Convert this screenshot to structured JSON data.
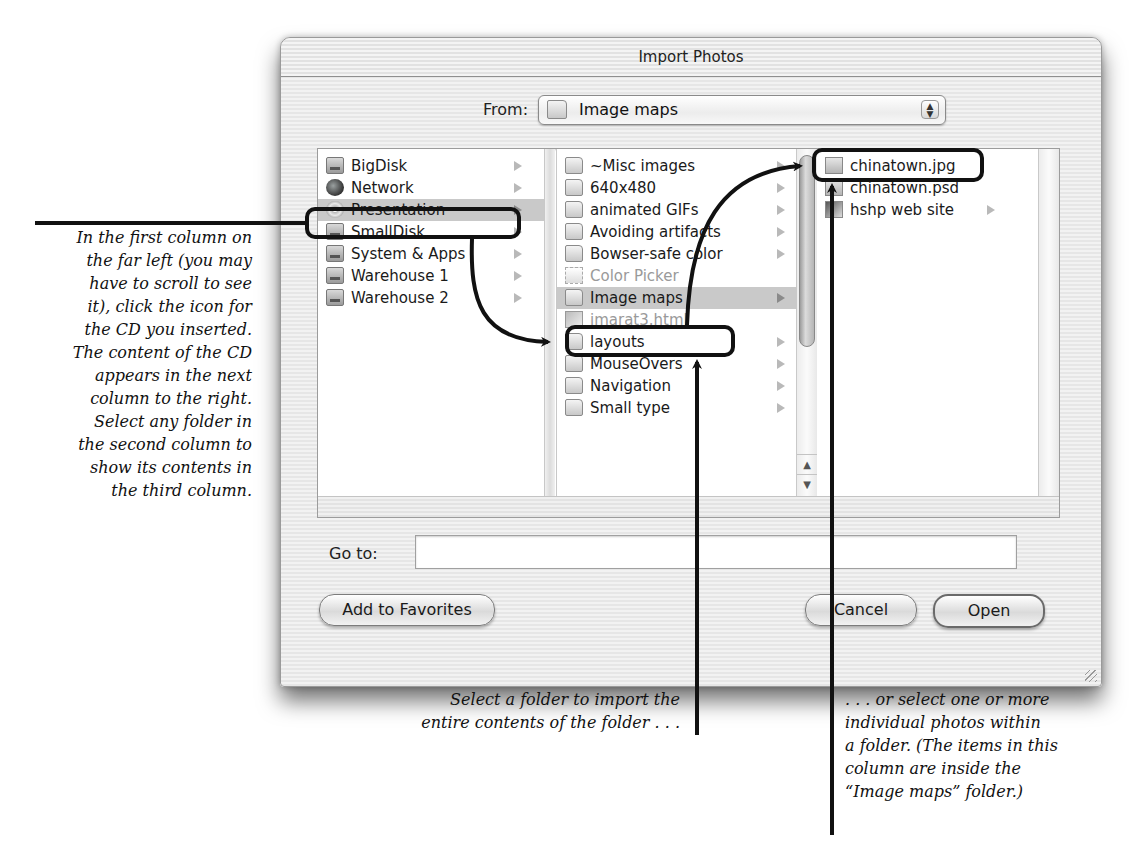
{
  "dialog": {
    "title": "Import Photos",
    "from_label": "From:",
    "from_value": "Image maps",
    "from_icon": "folder-icon",
    "goto_label": "Go to:",
    "goto_value": "",
    "buttons": {
      "add_to_favorites": "Add to Favorites",
      "cancel": "Cancel",
      "open": "Open"
    }
  },
  "browser": {
    "column1": [
      {
        "label": "BigDisk",
        "icon": "disk-icon",
        "has_children": true
      },
      {
        "label": "Network",
        "icon": "globe-icon",
        "has_children": true
      },
      {
        "label": "Presentation",
        "icon": "cd-icon",
        "has_children": true,
        "selected": true
      },
      {
        "label": "SmallDisk",
        "icon": "disk-icon",
        "has_children": true
      },
      {
        "label": "System & Apps",
        "icon": "disk-icon",
        "has_children": true
      },
      {
        "label": "Warehouse 1",
        "icon": "disk-icon",
        "has_children": true
      },
      {
        "label": "Warehouse 2",
        "icon": "disk-icon",
        "has_children": true
      }
    ],
    "column2": [
      {
        "label": "~Misc images",
        "icon": "folder-icon",
        "has_children": true
      },
      {
        "label": "640x480",
        "icon": "folder-icon",
        "has_children": true
      },
      {
        "label": "animated GIFs",
        "icon": "folder-icon",
        "has_children": true
      },
      {
        "label": "Avoiding artifacts",
        "icon": "folder-icon",
        "has_children": true
      },
      {
        "label": "Bowser-safe color",
        "icon": "folder-icon",
        "has_children": true
      },
      {
        "label": "Color Picker",
        "icon": "application-icon",
        "has_children": false,
        "dimmed": true
      },
      {
        "label": "Image maps",
        "icon": "folder-icon",
        "has_children": true,
        "selected": true
      },
      {
        "label": "imarat3.html",
        "icon": "html-file-icon",
        "has_children": false,
        "dimmed": true
      },
      {
        "label": "layouts",
        "icon": "folder-icon",
        "has_children": true
      },
      {
        "label": "MouseOvers",
        "icon": "folder-icon",
        "has_children": true
      },
      {
        "label": "Navigation",
        "icon": "folder-icon",
        "has_children": true
      },
      {
        "label": "Small type",
        "icon": "folder-icon",
        "has_children": true
      }
    ],
    "column3": [
      {
        "label": "chinatown.jpg",
        "icon": "image-file-icon",
        "has_children": false
      },
      {
        "label": "chinatown.psd",
        "icon": "image-file-icon",
        "has_children": false
      },
      {
        "label": "hshp web site",
        "icon": "site-folder-icon",
        "has_children": true
      }
    ]
  },
  "annotations": {
    "left": [
      "In the first column on",
      "the far left (you may",
      "have to scroll to see",
      "it), click the icon for",
      "the CD you inserted.",
      "The content of the CD",
      "appears in the next",
      "column to the right.",
      "Select any folder in",
      "the second column to",
      "show its contents in",
      "the third column."
    ],
    "middle": [
      "Select a folder to import the",
      "entire contents of the folder . . ."
    ],
    "right": [
      ". . . or select one or more",
      "individual photos within",
      "a folder. (The items in this",
      "column are inside the",
      "“Image maps” folder.)"
    ]
  },
  "colors": {
    "selection": "#c9c9c9",
    "callout_stroke": "#111111",
    "dimmed_text": "#9a9a9a"
  }
}
